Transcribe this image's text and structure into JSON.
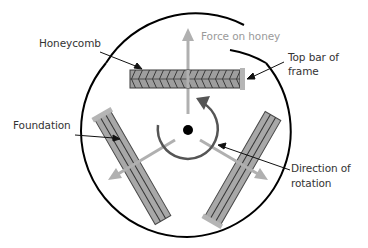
{
  "diagram": {
    "labels": {
      "honeycomb": "Honeycomb",
      "force_on_honey": "Force on honey",
      "top_bar_line1": "Top bar of",
      "top_bar_line2": "frame",
      "foundation": "Foundation",
      "direction_line1": "Direction of",
      "direction_line2": "rotation"
    },
    "colors": {
      "outline": "#000000",
      "frame_fill": "#a8a8a8",
      "frame_stroke": "#4a4a4a",
      "top_bar": "#b5b5b5",
      "force_arrow": "#b0b0b0",
      "rotation_arrow": "#555555",
      "label_text": "#333333",
      "force_label_text": "#9a9a9a"
    }
  }
}
